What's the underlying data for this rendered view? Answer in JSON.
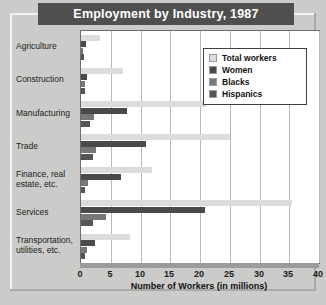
{
  "chart_data": {
    "type": "bar",
    "orientation": "horizontal",
    "title": "Employment by Industry, 1987",
    "xlabel": "Number of Workers (in millions)",
    "ylabel": "",
    "xlim": [
      0,
      40
    ],
    "xticks": [
      0,
      5,
      10,
      15,
      20,
      25,
      30,
      35,
      40
    ],
    "grid": true,
    "legend_position": "upper right",
    "categories": [
      "Agriculture",
      "Construction",
      "Manufacturing",
      "Trade",
      "Finance, real estate, etc.",
      "Services",
      "Transportation, utilities, etc."
    ],
    "series": [
      {
        "name": "Total workers",
        "color": "#dcdcdc",
        "values": [
          3.2,
          7.0,
          21.0,
          25.0,
          12.0,
          35.5,
          8.2
        ]
      },
      {
        "name": "Women",
        "color": "#4a4a4a",
        "values": [
          0.8,
          1.0,
          7.8,
          11.0,
          6.8,
          20.8,
          2.4
        ]
      },
      {
        "name": "Blacks",
        "color": "#777777",
        "values": [
          0.4,
          0.6,
          2.2,
          2.6,
          1.1,
          4.2,
          1.0
        ]
      },
      {
        "name": "Hispanics",
        "color": "#555555",
        "values": [
          0.5,
          0.7,
          1.5,
          2.0,
          0.7,
          2.1,
          0.7
        ]
      }
    ]
  },
  "header": {
    "title": "Employment by Industry, 1987"
  },
  "axis": {
    "x_title": "Number of Workers (in millions)",
    "tick_labels": [
      "0",
      "5",
      "10",
      "15",
      "20",
      "25",
      "30",
      "35",
      "40"
    ]
  },
  "categories": [
    {
      "line1": "Agriculture",
      "line2": ""
    },
    {
      "line1": "Construction",
      "line2": ""
    },
    {
      "line1": "Manufacturing",
      "line2": ""
    },
    {
      "line1": "Trade",
      "line2": ""
    },
    {
      "line1": "Finance, real",
      "line2": "estate, etc."
    },
    {
      "line1": "Services",
      "line2": ""
    },
    {
      "line1": "Transportation,",
      "line2": "utilities, etc."
    }
  ],
  "legend": {
    "items": [
      {
        "label": "Total workers",
        "color": "#dcdcdc"
      },
      {
        "label": "Women",
        "color": "#4a4a4a"
      },
      {
        "label": "Blacks",
        "color": "#777777"
      },
      {
        "label": "Hispanics",
        "color": "#555555"
      }
    ]
  }
}
